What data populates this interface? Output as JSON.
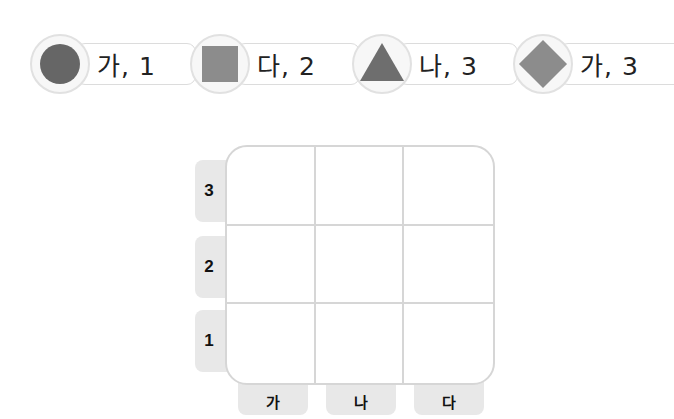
{
  "clues": [
    {
      "shape": "circle",
      "label": "가, 1",
      "color": "#666666"
    },
    {
      "shape": "square",
      "label": "다, 2",
      "color": "#8c8c8c"
    },
    {
      "shape": "triangle",
      "label": "나, 3",
      "color": "#6e6e6e"
    },
    {
      "shape": "diamond",
      "label": "가, 3",
      "color": "#8c8c8c"
    }
  ],
  "grid": {
    "row_labels": [
      "3",
      "2",
      "1"
    ],
    "col_labels": [
      "가",
      "나",
      "다"
    ],
    "border_color": "#d6d6d6",
    "label_bg": "#e8e8e8"
  }
}
